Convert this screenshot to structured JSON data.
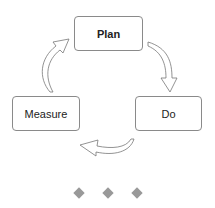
{
  "diagram": {
    "type": "cycle",
    "nodes": [
      {
        "id": "plan",
        "label": "Plan",
        "bold": true
      },
      {
        "id": "do",
        "label": "Do",
        "bold": false
      },
      {
        "id": "measure",
        "label": "Measure",
        "bold": false
      }
    ],
    "edges": [
      {
        "from": "plan",
        "to": "do"
      },
      {
        "from": "do",
        "to": "measure"
      },
      {
        "from": "measure",
        "to": "plan"
      }
    ]
  },
  "pagination": {
    "dots": 3
  },
  "colors": {
    "border": "#8a8a8a",
    "arrow": "#777777",
    "dot": "#999999"
  }
}
